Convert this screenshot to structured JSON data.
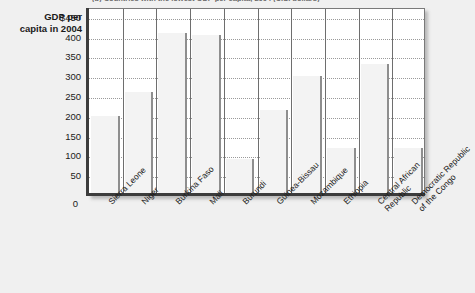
{
  "figure": {
    "caption": "(b) Countries with the lowest GDP per capita, 2004 (U.S. dollars)"
  },
  "chart_data": {
    "type": "bar",
    "title": "",
    "xlabel": "",
    "ylabel": "GDP per capita in 2004",
    "ylabel_lines": [
      "GDP per",
      "capita in 2004"
    ],
    "ylim": [
      0,
      475
    ],
    "grid": true,
    "legend": "none",
    "y_ticks": [
      450,
      400,
      350,
      300,
      250,
      200,
      150,
      100,
      50
    ],
    "y_tick_labels": [
      "$450",
      "400",
      "350",
      "300",
      "250",
      "200",
      "150",
      "100",
      "50"
    ],
    "zero_label": "0",
    "categories": [
      "Sierra Leone",
      "Niger",
      "Burkina Faso",
      "Mali",
      "Burundi",
      "Guinea-Bissau",
      "Mozambique",
      "Ethiopia",
      "Central African\nRepublic",
      "Democratic Republic\nof the Congo"
    ],
    "category_labels": [
      "Sierra Leone",
      "Niger",
      "Burkina Faso",
      "Mali",
      "Burundi",
      "Guinea-Bissau",
      "Mozambique",
      "Ethiopia",
      "Central African\nRepublic",
      "Democratic Republic\nof the Congo"
    ],
    "values": [
      200,
      260,
      410,
      405,
      90,
      215,
      300,
      120,
      330,
      120
    ],
    "bar_color": "#f3f3f3",
    "bar_edge_color": "#8e8e8e",
    "plot_background": "#ffffff",
    "page_background": "#f0f0f0",
    "grid_color": "#9a9a9a",
    "axis_color": "#3c3c3c"
  }
}
